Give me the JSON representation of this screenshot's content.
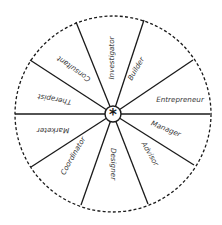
{
  "diagram": {
    "type": "wheel",
    "center_symbol": "*",
    "colors": {
      "line": "#1a1a1a",
      "text": "#3a3a3a",
      "background": "#ffffff"
    },
    "segments": [
      {
        "label": "Investigator",
        "angle": -90
      },
      {
        "label": "Builder",
        "angle": -60
      },
      {
        "label": "Entrepreneur",
        "angle": -12
      },
      {
        "label": "Manager",
        "angle": 22
      },
      {
        "label": "Advisor",
        "angle": 60
      },
      {
        "label": "Designer",
        "angle": 90
      },
      {
        "label": "Coordinator",
        "angle": 125
      },
      {
        "label": "Marketer",
        "angle": 180
      },
      {
        "label": "Therapist",
        "angle": 190
      },
      {
        "label": "Consultant",
        "angle": 215
      }
    ]
  }
}
